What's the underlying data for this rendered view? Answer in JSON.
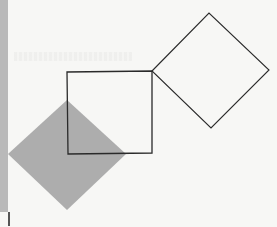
{
  "figure": {
    "title": "",
    "colors": {
      "background": "#f7f7f5",
      "stroke": "#2a2a2a",
      "fill_gray": "#adadad",
      "strip": "#b9b9b9"
    },
    "shapes": [
      {
        "id": "center-square",
        "type": "square",
        "points": "67,72 152,71 152,153 68,154",
        "fill": "none"
      },
      {
        "id": "right-diamond",
        "type": "square-rotated",
        "points": "152,71 209,13 269,70 211,128",
        "fill": "none"
      },
      {
        "id": "gray-diamond",
        "type": "square-rotated",
        "points": "67,100 126,154 67,210 8,154",
        "fill": "#adadad"
      }
    ]
  }
}
